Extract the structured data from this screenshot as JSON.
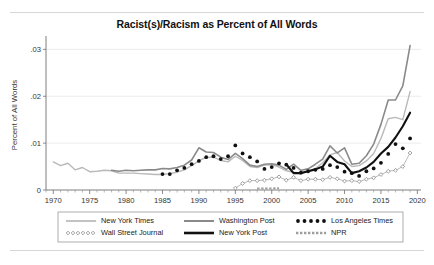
{
  "figure": {
    "title": "Racist(s)/Racism as Percent of All Words",
    "background": "#ffffff"
  },
  "chart_data": {
    "type": "line",
    "title": "Racist(s)/Racism as Percent of All Words",
    "xlabel": "",
    "ylabel": "Percent of All Words",
    "xlim": [
      1969,
      2020.5
    ],
    "ylim": [
      0,
      0.032
    ],
    "xticks": [
      1970,
      1975,
      1980,
      1985,
      1990,
      1995,
      2000,
      2005,
      2010,
      2015,
      2020
    ],
    "xtick_labels": [
      "1970",
      "1975",
      "1980",
      "1985",
      "1990",
      "1995",
      "2000",
      "2005",
      "2010",
      "2015",
      "2020"
    ],
    "xminor_step": 1,
    "yticks": [
      0,
      0.01,
      0.02,
      0.03
    ],
    "ytick_labels": [
      "0",
      ".01",
      ".02",
      ".03"
    ],
    "grid": "horizontal",
    "legend_position": "below-axes",
    "colors": {
      "new_york_times": "#b9b9b9",
      "washington_post": "#8a8a8a",
      "los_angeles_times": "#111111",
      "wall_street_journal": "#777777",
      "new_york_post": "#111111",
      "npr": "#9e9e9e",
      "grid": "#e2e2e2",
      "axis": "#6f6f6f"
    },
    "series": [
      {
        "name": "New York Times",
        "style": "solid-thin-light",
        "color": "#b9b9b9",
        "x": [
          1970,
          1971,
          1972,
          1973,
          1974,
          1975,
          1976,
          1977,
          1978,
          1979,
          1980,
          1981,
          1982,
          1983,
          1984,
          1985,
          1986,
          1987,
          1988,
          1989,
          1990,
          1991,
          1992,
          1993,
          1994,
          1995,
          1996,
          1997,
          1998,
          1999,
          2000,
          2001,
          2002,
          2003,
          2004,
          2005,
          2006,
          2007,
          2008,
          2009,
          2010,
          2011,
          2012,
          2013,
          2014,
          2015,
          2016,
          2017,
          2018,
          2019
        ],
        "values": [
          0.006,
          0.0052,
          0.0057,
          0.0043,
          0.0048,
          0.0039,
          0.004,
          0.0042,
          0.0041,
          0.0036,
          0.0036,
          0.0036,
          0.0035,
          0.0034,
          0.0033,
          0.0033,
          0.0035,
          0.0038,
          0.0043,
          0.0052,
          0.0062,
          0.007,
          0.007,
          0.0063,
          0.006,
          0.0072,
          0.0063,
          0.005,
          0.0048,
          0.0053,
          0.0054,
          0.0049,
          0.0041,
          0.0038,
          0.0036,
          0.004,
          0.0046,
          0.0058,
          0.0075,
          0.008,
          0.0062,
          0.005,
          0.0052,
          0.0062,
          0.0078,
          0.011,
          0.0152,
          0.0155,
          0.015,
          0.021
        ]
      },
      {
        "name": "Washington Post",
        "style": "solid-medium-gray",
        "color": "#8a8a8a",
        "x": [
          1978,
          1979,
          1980,
          1981,
          1982,
          1983,
          1984,
          1985,
          1986,
          1987,
          1988,
          1989,
          1990,
          1991,
          1992,
          1993,
          1994,
          1995,
          1996,
          1997,
          1998,
          1999,
          2000,
          2001,
          2002,
          2003,
          2004,
          2005,
          2006,
          2007,
          2008,
          2009,
          2010,
          2011,
          2012,
          2013,
          2014,
          2015,
          2016,
          2017,
          2018,
          2019
        ],
        "values": [
          0.0042,
          0.004,
          0.0042,
          0.0041,
          0.0042,
          0.0043,
          0.0043,
          0.0046,
          0.0045,
          0.0048,
          0.0053,
          0.0064,
          0.009,
          0.0081,
          0.008,
          0.007,
          0.0065,
          0.0078,
          0.0067,
          0.0053,
          0.005,
          0.0055,
          0.0056,
          0.0053,
          0.0044,
          0.0055,
          0.0042,
          0.0045,
          0.0055,
          0.0066,
          0.0094,
          0.0079,
          0.009,
          0.0055,
          0.0057,
          0.0073,
          0.0098,
          0.014,
          0.0192,
          0.0192,
          0.0222,
          0.0308
        ]
      },
      {
        "name": "Los Angeles Times",
        "style": "dotted-markers",
        "color": "#111111",
        "x": [
          1985,
          1986,
          1987,
          1988,
          1989,
          1990,
          1991,
          1992,
          1993,
          1994,
          1995,
          1996,
          1997,
          1998,
          1999,
          2000,
          2001,
          2002,
          2003,
          2004,
          2005,
          2006,
          2007,
          2008,
          2009,
          2010,
          2011,
          2012,
          2013,
          2014,
          2015,
          2016,
          2017,
          2018,
          2019
        ],
        "values": [
          0.0034,
          0.0034,
          0.0042,
          0.0047,
          0.0055,
          0.0062,
          0.007,
          0.0072,
          0.0066,
          0.0072,
          0.0095,
          0.0078,
          0.007,
          0.0061,
          0.0045,
          0.0049,
          0.0057,
          0.0054,
          0.0047,
          0.0037,
          0.004,
          0.0043,
          0.0045,
          0.0053,
          0.0049,
          0.0039,
          0.0036,
          0.003,
          0.004,
          0.0046,
          0.0058,
          0.0077,
          0.0098,
          0.0089,
          0.011
        ]
      },
      {
        "name": "Wall Street Journal",
        "style": "open-diamond-markers",
        "color": "#777777",
        "x": [
          1995,
          1996,
          1997,
          1998,
          1999,
          2000,
          2001,
          2002,
          2003,
          2004,
          2005,
          2006,
          2007,
          2008,
          2009,
          2010,
          2011,
          2012,
          2013,
          2014,
          2015,
          2016,
          2017,
          2018,
          2019
        ],
        "values": [
          0.0004,
          0.0014,
          0.002,
          0.002,
          0.0021,
          0.0024,
          0.0028,
          0.0021,
          0.0027,
          0.002,
          0.0023,
          0.0023,
          0.0022,
          0.0027,
          0.0024,
          0.0019,
          0.002,
          0.0018,
          0.0023,
          0.0026,
          0.0033,
          0.004,
          0.0042,
          0.005,
          0.0079
        ]
      },
      {
        "name": "New York Post",
        "style": "solid-thick-black",
        "color": "#111111",
        "x": [
          2002,
          2003,
          2004,
          2005,
          2006,
          2007,
          2008,
          2009,
          2010,
          2011,
          2012,
          2013,
          2014,
          2015,
          2016,
          2017,
          2018,
          2019
        ],
        "values": [
          0.0055,
          0.0036,
          0.0036,
          0.004,
          0.0044,
          0.005,
          0.0073,
          0.006,
          0.0055,
          0.0036,
          0.004,
          0.0048,
          0.006,
          0.0078,
          0.0092,
          0.0112,
          0.0136,
          0.0165
        ]
      },
      {
        "name": "NPR",
        "style": "dashed-small-gray",
        "color": "#9e9e9e",
        "x": [
          1998,
          1999,
          2000,
          2001
        ],
        "values": [
          0.0003,
          0.0003,
          0.0003,
          0.0004
        ]
      }
    ]
  },
  "legend": {
    "entries": [
      {
        "label": "New York Times",
        "marker": "line-light-gray"
      },
      {
        "label": "Washington Post",
        "marker": "line-medium-gray"
      },
      {
        "label": "Los Angeles Times",
        "marker": "dots-black"
      },
      {
        "label": "Wall Street Journal",
        "marker": "open-diamonds"
      },
      {
        "label": "New York Post",
        "marker": "line-thick-black"
      },
      {
        "label": "NPR",
        "marker": "dashes-gray"
      }
    ]
  }
}
